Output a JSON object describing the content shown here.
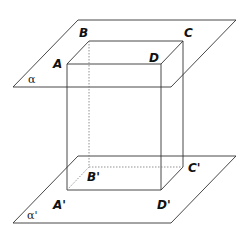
{
  "diagram": {
    "planes": [
      {
        "id": "top",
        "label": "α"
      },
      {
        "id": "bottom",
        "label": "α'"
      }
    ],
    "vertices": {
      "A": "A",
      "B": "B",
      "C": "C",
      "D": "D",
      "A_prime": "A'",
      "B_prime": "B'",
      "C_prime": "C'",
      "D_prime": "D'"
    }
  }
}
